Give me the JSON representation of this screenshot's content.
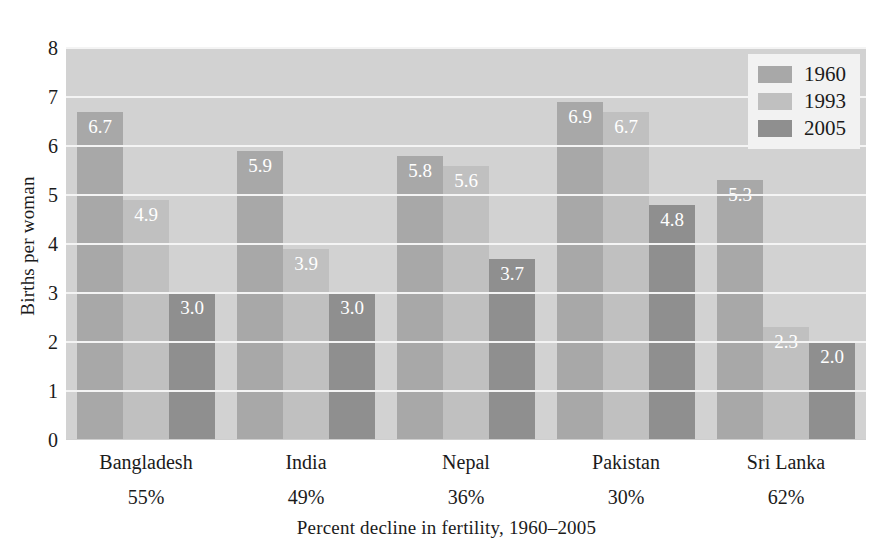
{
  "chart_data": {
    "type": "bar",
    "title": "",
    "xlabel": "Percent decline in fertility,  1960–2005",
    "ylabel": "Births per woman",
    "ylim": [
      0,
      8
    ],
    "yticks": [
      0,
      1,
      2,
      3,
      4,
      5,
      6,
      7,
      8
    ],
    "ytick_labels": [
      "0",
      "1",
      "2",
      "3",
      "4",
      "5",
      "6",
      "7",
      "8"
    ],
    "grid": true,
    "legend_position": "top-right",
    "categories": [
      "Bangladesh",
      "India",
      "Nepal",
      "Pakistan",
      "Sri Lanka"
    ],
    "category_sublabels": [
      "55%",
      "49%",
      "36%",
      "30%",
      "62%"
    ],
    "series": [
      {
        "name": "1960",
        "color": "#a8a8a8",
        "values": [
          6.7,
          5.9,
          5.8,
          6.9,
          5.3
        ],
        "labels": [
          "6.7",
          "5.9",
          "5.8",
          "6.9",
          "5.3"
        ]
      },
      {
        "name": "1993",
        "color": "#c0c0c0",
        "values": [
          4.9,
          3.9,
          5.6,
          6.7,
          2.3
        ],
        "labels": [
          "4.9",
          "3.9",
          "5.6",
          "6.7",
          "2.3"
        ]
      },
      {
        "name": "2005",
        "color": "#8f8f8f",
        "values": [
          3.0,
          3.0,
          3.7,
          4.8,
          2.0
        ],
        "labels": [
          "3.0",
          "3.0",
          "3.7",
          "4.8",
          "2.0"
        ]
      }
    ]
  },
  "legend": {
    "items": [
      {
        "label": "1960",
        "swatch": "y1960"
      },
      {
        "label": "1993",
        "swatch": "y1993"
      },
      {
        "label": "2005",
        "swatch": "y2005"
      }
    ]
  },
  "colors": {
    "plot_background": "#d2d2d2",
    "gridline": "#f4f4f4",
    "legend_background": "#f2f2f2",
    "value_label": "#ffffff",
    "text": "#1b1b1b"
  }
}
